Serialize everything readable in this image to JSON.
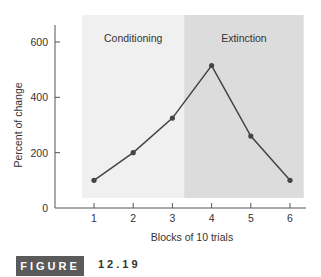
{
  "chart_data": {
    "type": "line",
    "title": "",
    "xlabel": "Blocks of 10 trials",
    "ylabel": "Percent of change",
    "categories": [
      1,
      2,
      3,
      4,
      5,
      6
    ],
    "series": [
      {
        "name": "Percent of change",
        "values": [
          100,
          200,
          325,
          515,
          260,
          100
        ]
      }
    ],
    "regions": [
      {
        "label": "Conditioning",
        "x_start": 0.7,
        "x_end": 3.3,
        "color": "#f0f0f0"
      },
      {
        "label": "Extinction",
        "x_start": 3.3,
        "x_end": 6.35,
        "color": "#dcdcdc"
      }
    ],
    "yticks": [
      0,
      200,
      400,
      600
    ],
    "xticks": [
      1,
      2,
      3,
      4,
      5,
      6
    ],
    "ylim": [
      0,
      660
    ],
    "xlim": [
      0.4,
      6.4
    ],
    "grid": false,
    "legend": "none"
  },
  "figure": {
    "label": "FIGURE",
    "number": "12.19"
  },
  "colors": {
    "line": "#444444",
    "marker": "#444444",
    "conditioning_bg": "#f0f0f0",
    "extinction_bg": "#dcdcdc",
    "figure_label_bg": "#5a5a5a"
  }
}
